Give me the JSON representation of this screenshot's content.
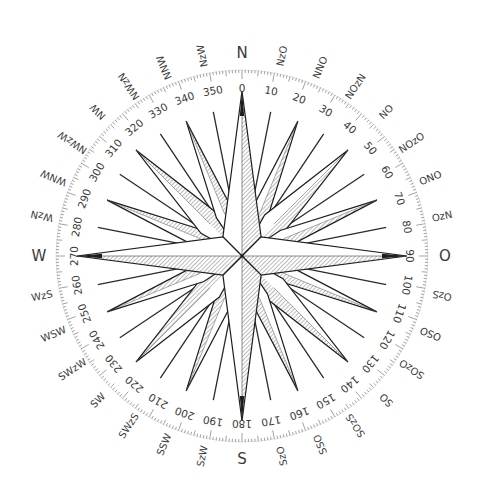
{
  "figure": {
    "center": [
      242,
      256
    ],
    "colors": {
      "background": "#ffffff",
      "ink": "#1e1e1e",
      "hatch": "#6e6e6e",
      "scale_ticks": "#8a8a8a",
      "labels": "#3a3a3a"
    }
  },
  "cardinals": [
    {
      "label": "N",
      "angle": 0
    },
    {
      "label": "O",
      "angle": 90
    },
    {
      "label": "S",
      "angle": 180
    },
    {
      "label": "W",
      "angle": 270
    }
  ],
  "point_labels": [
    {
      "label": "NzO",
      "angle": 11.25
    },
    {
      "label": "NNO",
      "angle": 22.5
    },
    {
      "label": "NOzN",
      "angle": 33.75
    },
    {
      "label": "NO",
      "angle": 45
    },
    {
      "label": "NOzO",
      "angle": 56.25
    },
    {
      "label": "ONO",
      "angle": 67.5
    },
    {
      "label": "OzN",
      "angle": 78.75
    },
    {
      "label": "OzS",
      "angle": 101.25
    },
    {
      "label": "OSO",
      "angle": 112.5
    },
    {
      "label": "SOzO",
      "angle": 123.75
    },
    {
      "label": "SO",
      "angle": 135
    },
    {
      "label": "SOzS",
      "angle": 146.25
    },
    {
      "label": "SSO",
      "angle": 157.5
    },
    {
      "label": "SzO",
      "angle": 168.75
    },
    {
      "label": "SzW",
      "angle": 191.25
    },
    {
      "label": "SSW",
      "angle": 202.5
    },
    {
      "label": "SWzS",
      "angle": 213.75
    },
    {
      "label": "SW",
      "angle": 225
    },
    {
      "label": "SWzW",
      "angle": 236.25
    },
    {
      "label": "WSW",
      "angle": 247.5
    },
    {
      "label": "WzS",
      "angle": 258.75
    },
    {
      "label": "WzN",
      "angle": 281.25
    },
    {
      "label": "WNW",
      "angle": 292.5
    },
    {
      "label": "NWzW",
      "angle": 303.75
    },
    {
      "label": "NW",
      "angle": 315
    },
    {
      "label": "NWzN",
      "angle": 326.25
    },
    {
      "label": "NNW",
      "angle": 337.5
    },
    {
      "label": "NzW",
      "angle": 348.75
    }
  ],
  "degree_scale": {
    "labels": [
      "0",
      "10",
      "20",
      "30",
      "40",
      "50",
      "60",
      "70",
      "80",
      "90",
      "100",
      "110",
      "120",
      "130",
      "140",
      "150",
      "160",
      "170",
      "180",
      "190",
      "200",
      "210",
      "220",
      "230",
      "240",
      "250",
      "260",
      "270",
      "280",
      "290",
      "300",
      "310",
      "320",
      "330",
      "340",
      "350"
    ],
    "step": 10,
    "minor_tick_step": 1
  },
  "rose": {
    "main_points": [
      0,
      90,
      180,
      270
    ],
    "secondary_points": [
      22.5,
      45,
      67.5,
      112.5,
      135,
      157.5,
      202.5,
      225,
      247.5,
      292.5,
      315,
      337.5
    ],
    "rays": [
      11.25,
      33.75,
      56.25,
      78.75,
      101.25,
      123.75,
      146.25,
      168.75,
      191.25,
      213.75,
      236.25,
      258.75,
      281.25,
      303.75,
      326.25,
      348.75
    ]
  }
}
